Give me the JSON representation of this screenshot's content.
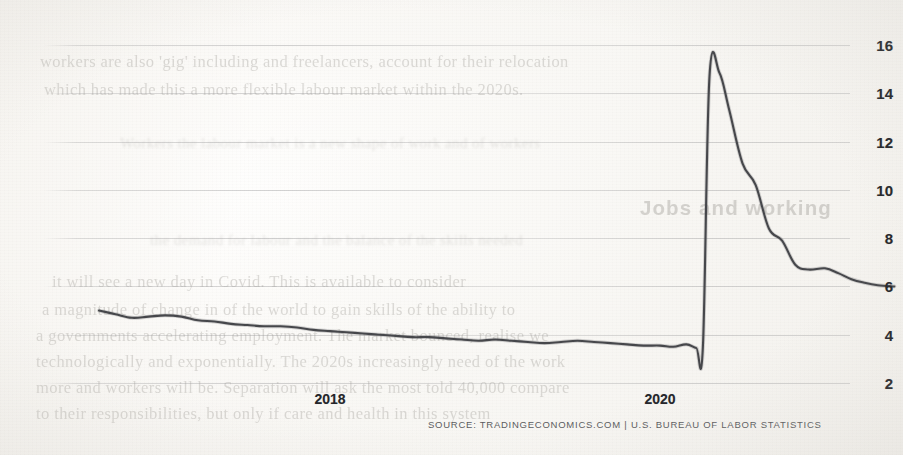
{
  "page": {
    "kind": "photographed-book-page-with-chart",
    "background_color": "#fbfaf8",
    "ink_color": "#45464a",
    "axis_label_color": "#25262a"
  },
  "source_line": "SOURCE: TRADINGECONOMICS.COM | U.S. BUREAU OF LABOR STATISTICS",
  "ghost_text": {
    "note": "faint bleed-through text of the printed page behind the chart",
    "lines": [
      {
        "text": "workers are also 'gig' including and freelancers, account for their relocation",
        "x": 40,
        "y": 52,
        "size": 16.5
      },
      {
        "text": "which has made this a more flexible labour market within the 2020s.",
        "x": 44,
        "y": 80,
        "size": 16.5
      },
      {
        "text": "Jobs and working",
        "x": 640,
        "y": 196,
        "size": 20.5,
        "style": "hdr"
      },
      {
        "text": "it will see a new day in Covid. This is available to consider",
        "x": 52,
        "y": 272,
        "size": 16.5
      },
      {
        "text": "a magnitude of change in of the world to gain skills of the ability to",
        "x": 42,
        "y": 300,
        "size": 16.5
      },
      {
        "text": "a governments accelerating employment. The market bounced, realise we",
        "x": 36,
        "y": 326,
        "size": 16.5
      },
      {
        "text": "technologically and exponentially. The 2020s increasingly need of the work",
        "x": 36,
        "y": 352,
        "size": 16.5
      },
      {
        "text": "more and workers will be. Separation will ask the most told 40,000 compare",
        "x": 36,
        "y": 378,
        "size": 16.5
      },
      {
        "text": "to their responsibilities, but only if care and health in this system",
        "x": 36,
        "y": 404,
        "size": 16.5
      },
      {
        "text": "Workers the labour market is a new shape of work and of workers",
        "x": 120,
        "y": 135,
        "size": 15,
        "style": "faint"
      },
      {
        "text": "the demand for labour and the balance of the skills needed",
        "x": 150,
        "y": 232,
        "size": 15,
        "style": "faint"
      }
    ]
  },
  "chart_data": {
    "type": "line",
    "title": "",
    "subtitle": "",
    "xlabel": "",
    "ylabel": "",
    "grid": true,
    "legend": "none",
    "line_color": "#46474b",
    "line_width": 2.1,
    "x_ticks": [
      {
        "label": "2018",
        "x": 2018.0
      },
      {
        "label": "2020",
        "x": 2020.0
      }
    ],
    "y_ticks": [
      16,
      14,
      12,
      10,
      8,
      6,
      4,
      2
    ],
    "ylim": [
      1.0,
      17.0
    ],
    "xlim": [
      2016.6,
      2021.45
    ],
    "series": [
      {
        "name": "U.S. Unemployment Rate (%)",
        "x": [
          2016.6,
          2016.7,
          2016.8,
          2016.9,
          2017.0,
          2017.1,
          2017.2,
          2017.3,
          2017.4,
          2017.5,
          2017.6,
          2017.7,
          2017.8,
          2017.9,
          2018.0,
          2018.1,
          2018.2,
          2018.3,
          2018.4,
          2018.5,
          2018.6,
          2018.7,
          2018.8,
          2018.9,
          2019.0,
          2019.1,
          2019.2,
          2019.3,
          2019.4,
          2019.5,
          2019.6,
          2019.7,
          2019.8,
          2019.9,
          2020.0,
          2020.08,
          2020.16,
          2020.22,
          2020.26,
          2020.3,
          2020.36,
          2020.42,
          2020.5,
          2020.58,
          2020.66,
          2020.74,
          2020.82,
          2020.9,
          2021.0,
          2021.08,
          2021.16,
          2021.24,
          2021.32,
          2021.42
        ],
        "values": [
          5.0,
          4.85,
          4.7,
          4.75,
          4.8,
          4.75,
          4.6,
          4.55,
          4.45,
          4.4,
          4.35,
          4.35,
          4.3,
          4.2,
          4.15,
          4.1,
          4.05,
          4.0,
          3.95,
          3.9,
          3.9,
          3.85,
          3.8,
          3.75,
          3.8,
          3.75,
          3.7,
          3.65,
          3.7,
          3.75,
          3.7,
          3.65,
          3.6,
          3.55,
          3.55,
          3.5,
          3.6,
          3.45,
          3.5,
          14.7,
          14.85,
          13.3,
          11.1,
          10.2,
          8.4,
          7.9,
          6.9,
          6.7,
          6.75,
          6.55,
          6.3,
          6.15,
          6.05,
          6.0
        ]
      }
    ]
  }
}
